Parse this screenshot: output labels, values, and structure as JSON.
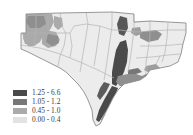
{
  "figure": {
    "type": "choropleth-map",
    "background_color": "#ffffff",
    "region_description": "South-central United States aquifer / county choropleth"
  },
  "legend": {
    "name": "map-legend",
    "position": "lower-left",
    "classes": [
      {
        "label": "1.25 - 6.6",
        "color": "#4a4a4a",
        "min": 1.25,
        "max": 6.6
      },
      {
        "label": "1.05 - 1.2",
        "color": "#777777",
        "min": 1.05,
        "max": 1.2
      },
      {
        "label": "0.45 - 1.0",
        "color": "#aaaaaa",
        "min": 0.45,
        "max": 1.0
      },
      {
        "label": "0.00 - 0.4",
        "color": "#e2e2e2",
        "min": 0.0,
        "max": 0.4
      }
    ]
  },
  "map": {
    "outline_color": "#8c8c8c",
    "base_fill": "#ececec",
    "boundary_color": "#b4b4b4",
    "classes": {
      "c1": "#4a4a4a",
      "c2": "#777777",
      "c3": "#aaaaaa",
      "c4": "#e2e2e2"
    }
  }
}
